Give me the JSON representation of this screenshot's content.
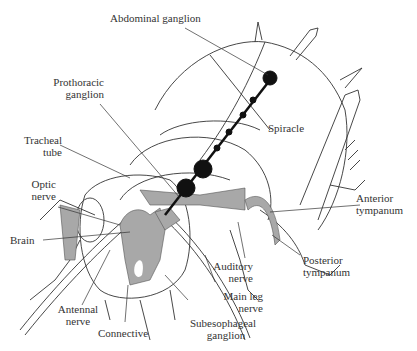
{
  "diagram": {
    "colors": {
      "outline": "#333333",
      "nervous_tissue": "#a8a8a8",
      "ganglion": "#111111",
      "background": "#ffffff"
    },
    "labels": {
      "abdominal_ganglion": "Abdominal ganglion",
      "prothoracic_ganglion_1": "Prothoracic",
      "prothoracic_ganglion_2": "ganglion",
      "tracheal_tube_1": "Tracheal",
      "tracheal_tube_2": "tube",
      "spiracle": "Spiracle",
      "optic_nerve_1": "Optic",
      "optic_nerve_2": "nerve",
      "brain": "Brain",
      "anterior_tympanum_1": "Anterior",
      "anterior_tympanum_2": "tympanum",
      "posterior_tympanum_1": "Posterior",
      "posterior_tympanum_2": "tympanum",
      "auditory_nerve_1": "Auditory",
      "auditory_nerve_2": "nerve",
      "main_leg_nerve_1": "Main leg",
      "main_leg_nerve_2": "nerve",
      "antennal_nerve_1": "Antennal",
      "antennal_nerve_2": "nerve",
      "connective": "Connective",
      "subesophageal_ganglion_1": "Subesophageal",
      "subesophageal_ganglion_2": "ganglion"
    }
  }
}
